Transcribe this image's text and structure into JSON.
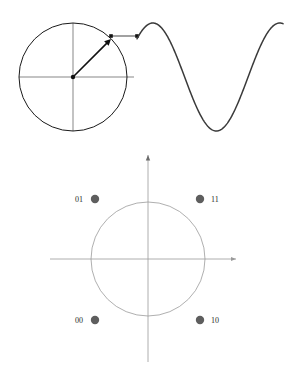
{
  "figure": {
    "title": "",
    "background_color": "#ffffff"
  },
  "phasor_diagram": {
    "name": "rotating-phasor-with-sine-wave",
    "circle": {
      "center_x": 73,
      "center_y": 77,
      "radius": 54,
      "stroke_color": "#1a1a1a",
      "stroke_width": 1
    },
    "axes": {
      "stroke_color": "#555555",
      "stroke_width": 0.7,
      "horizontal": {
        "x1": 19,
        "y1": 77,
        "x2": 134,
        "y2": 77
      },
      "vertical": {
        "x1": 73,
        "y1": 23,
        "x2": 73,
        "y2": 131
      }
    },
    "center_dot": {
      "x": 73,
      "y": 77,
      "r": 2.2,
      "color": "#111111"
    },
    "radius_vector": {
      "from_x": 73,
      "from_y": 77,
      "to_x": 111,
      "to_y": 39,
      "angle_degrees": 45,
      "stroke_color": "#111111",
      "stroke_width": 1.6,
      "has_arrowhead": true
    },
    "connector": {
      "from_x": 111,
      "from_y": 36,
      "to_x": 137,
      "to_y": 36,
      "stroke_color": "#8a8a8a",
      "stroke_width": 1.6,
      "end_marker": true
    },
    "waveform": {
      "type": "sine",
      "stroke_color": "#3a3a3a",
      "stroke_width": 1.5,
      "start_x": 137,
      "end_x": 283,
      "baseline_y": 77,
      "amplitude": 54,
      "phase_start_degrees": 45,
      "cycles": 1.15
    }
  },
  "constellation_diagram": {
    "name": "qpsk-constellation",
    "circle": {
      "center_x": 148,
      "center_y": 259,
      "radius": 57,
      "stroke_color": "#9a9a9a",
      "stroke_width": 0.8
    },
    "axes": {
      "stroke_color": "#9a9a9a",
      "stroke_width": 0.8,
      "horizontal": {
        "x1": 50,
        "y1": 259,
        "x2": 236,
        "y2": 259
      },
      "vertical": {
        "x1": 148,
        "y1": 155,
        "x2": 148,
        "y2": 362
      },
      "vertical_arrow": true,
      "horizontal_arrow": true
    },
    "point_style": {
      "radius": 4.2,
      "fill_color": "#5e5e5e"
    },
    "points": [
      {
        "label": "01",
        "x": 95,
        "y": 199,
        "label_x": 83,
        "label_y": 202,
        "label_anchor": "end"
      },
      {
        "label": "11",
        "x": 200,
        "y": 199,
        "label_x": 211,
        "label_y": 202,
        "label_anchor": "start"
      },
      {
        "label": "00",
        "x": 95,
        "y": 320,
        "label_x": 83,
        "label_y": 323,
        "label_anchor": "end"
      },
      {
        "label": "10",
        "x": 200,
        "y": 320,
        "label_x": 211,
        "label_y": 323,
        "label_anchor": "start"
      }
    ]
  }
}
